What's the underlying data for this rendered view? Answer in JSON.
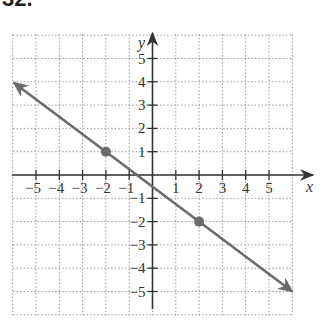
{
  "problem_number": "32.",
  "chart_data": {
    "type": "line",
    "title": "",
    "xlabel": "x",
    "ylabel": "y",
    "xlim": [
      -6,
      6
    ],
    "ylim": [
      -6,
      6
    ],
    "grid": true,
    "x_ticks": [
      -5,
      -4,
      -3,
      -2,
      -1,
      1,
      2,
      3,
      4,
      5
    ],
    "y_ticks": [
      -5,
      -4,
      -3,
      -2,
      -1,
      1,
      2,
      3,
      4,
      5
    ],
    "series": [
      {
        "name": "line",
        "equation": "y = -3/4 x - 1/2",
        "slope": -0.75,
        "intercept": -0.5,
        "arrows": "both",
        "color": "#6b6b6b",
        "x": [
          -6,
          6
        ],
        "y": [
          4,
          -5
        ]
      }
    ],
    "points": [
      {
        "x": -2,
        "y": 1
      },
      {
        "x": 2,
        "y": -2
      }
    ]
  },
  "colors": {
    "axis": "#333333",
    "grid": "#9a9a9a",
    "line": "#6b6b6b",
    "point": "#6b6b6b"
  }
}
